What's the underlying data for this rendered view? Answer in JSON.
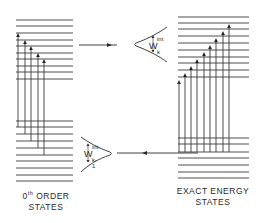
{
  "diagram": {
    "left_stack": {
      "label_line1": "0",
      "label_sup": "th",
      "label_line1_rest": " ORDER",
      "label_line2": "STATES",
      "upper_levels_y": [
        20,
        26,
        33,
        40,
        46,
        53,
        59,
        66,
        72,
        79
      ],
      "lower_levels_y": [
        121,
        127,
        134,
        141,
        148,
        155,
        161,
        168,
        175,
        181
      ],
      "x_start": 16,
      "x_end": 73,
      "arrows": [
        {
          "x": 18,
          "top": 33,
          "bottom": 127
        },
        {
          "x": 25,
          "top": 40,
          "bottom": 134
        },
        {
          "x": 31,
          "top": 46,
          "bottom": 141
        },
        {
          "x": 38,
          "top": 53,
          "bottom": 148
        },
        {
          "x": 44,
          "top": 59,
          "bottom": 155
        }
      ]
    },
    "right_stack": {
      "label_line1": "EXACT ENERGY",
      "label_line2": "STATES",
      "upper_levels_y": [
        17,
        23,
        29,
        36,
        43,
        50,
        57,
        63,
        70,
        77
      ],
      "lower_levels_y": [
        138,
        144,
        152,
        158,
        165,
        172,
        178
      ],
      "x_start": 178,
      "x_end": 249,
      "arrows": [
        {
          "x": 179,
          "top": 80,
          "bottom": 152
        },
        {
          "x": 185,
          "top": 73,
          "bottom": 152
        },
        {
          "x": 191,
          "top": 66,
          "bottom": 152
        },
        {
          "x": 197,
          "top": 59,
          "bottom": 152
        },
        {
          "x": 204,
          "top": 52,
          "bottom": 152
        },
        {
          "x": 210,
          "top": 45,
          "bottom": 152
        },
        {
          "x": 216,
          "top": 38,
          "bottom": 152
        },
        {
          "x": 223,
          "top": 31,
          "bottom": 152
        },
        {
          "x": 229,
          "top": 24,
          "bottom": 152
        }
      ]
    },
    "transition_top": {
      "direction": "right",
      "width_symbol": "W",
      "width_sup": "int",
      "width_sub": "k"
    },
    "transition_bottom": {
      "direction": "left",
      "width_symbol": "W",
      "width_sup": "int",
      "width_sub": "k-1"
    },
    "colors": {
      "line": "#3a3a3a",
      "background": "#ffffff"
    }
  }
}
